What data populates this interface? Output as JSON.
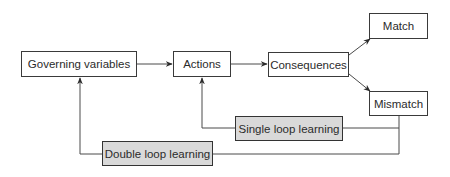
{
  "diagram": {
    "title": "",
    "nodes": {
      "governing_variables": "Governing variables",
      "actions": "Actions",
      "consequences": "Consequences",
      "match": "Match",
      "mismatch": "Mismatch",
      "single_loop": "Single loop learning",
      "double_loop": "Double loop learning"
    },
    "edges": [
      {
        "from": "Governing variables",
        "to": "Actions"
      },
      {
        "from": "Actions",
        "to": "Consequences"
      },
      {
        "from": "Consequences",
        "to": "Match"
      },
      {
        "from": "Consequences",
        "to": "Mismatch"
      },
      {
        "from": "Mismatch",
        "to": "Actions",
        "via": "Single loop learning"
      },
      {
        "from": "Mismatch",
        "to": "Governing variables",
        "via": "Double loop learning"
      }
    ],
    "colors": {
      "line": "#4a4a4a",
      "box_border": "#3a3a3a",
      "shaded_fill": "#d9d9d9"
    }
  }
}
